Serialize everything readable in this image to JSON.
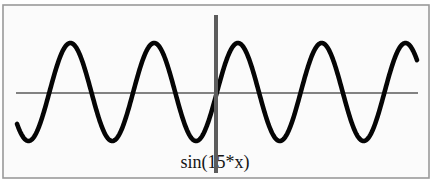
{
  "chart_data": {
    "type": "line",
    "title": "",
    "function": {
      "expression": "sin(15*x)",
      "coefficient": 15
    },
    "series": [
      {
        "name": "sin(15*x)",
        "x": [
          -1.0,
          -0.9,
          -0.8,
          -0.7,
          -0.6,
          -0.5,
          -0.4,
          -0.3,
          -0.2,
          -0.1,
          0.0,
          0.1,
          0.2,
          0.3,
          0.4,
          0.5,
          0.6,
          0.7,
          0.8,
          0.9,
          1.0
        ],
        "values": [
          -0.65,
          -0.804,
          0.537,
          0.88,
          -0.412,
          -0.938,
          0.279,
          0.978,
          -0.141,
          -0.997,
          0.0,
          0.997,
          0.141,
          -0.978,
          -0.279,
          0.938,
          0.412,
          -0.88,
          -0.537,
          0.804,
          0.65
        ]
      }
    ],
    "xlabel": "sin(15*x)",
    "ylabel": "",
    "xlim": [
      -1,
      1
    ],
    "ylim": [
      -1,
      1
    ],
    "tick_labels": [],
    "grid": false,
    "legend": "none",
    "colors": {
      "curve": "#050505",
      "axes": "#5a5a5a",
      "frame": "#9a9a9a"
    }
  },
  "plot": {
    "label": "sin(15*x)"
  }
}
